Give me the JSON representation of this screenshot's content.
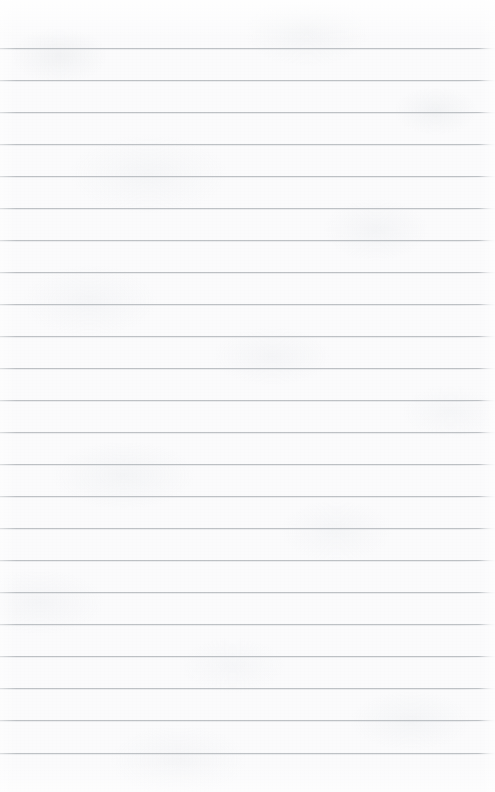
{
  "document": {
    "type": "ruled-notebook-page",
    "title": "Blank Lined Paper",
    "content_text": "",
    "page_width": 495,
    "page_height": 792,
    "paper_color": "#fbfbfc",
    "rule_color": "#b9bdc1",
    "rule_thickness_px": 1,
    "rule_spacing_px": 32,
    "first_rule_y": 48,
    "last_rule_y": 753,
    "top_margin_px": 48,
    "bottom_margin_px": 39,
    "left_margin_px": 0,
    "right_margin_px": 0,
    "rule_count": 23,
    "has_vertical_margin_rule": false,
    "has_header_text": false,
    "has_handwriting": false
  },
  "rule_positions": [
    48,
    80,
    112,
    144,
    176,
    208,
    240,
    272,
    304,
    336,
    368,
    400,
    432,
    464,
    496,
    528,
    560,
    592,
    624,
    656,
    688,
    720,
    753
  ]
}
